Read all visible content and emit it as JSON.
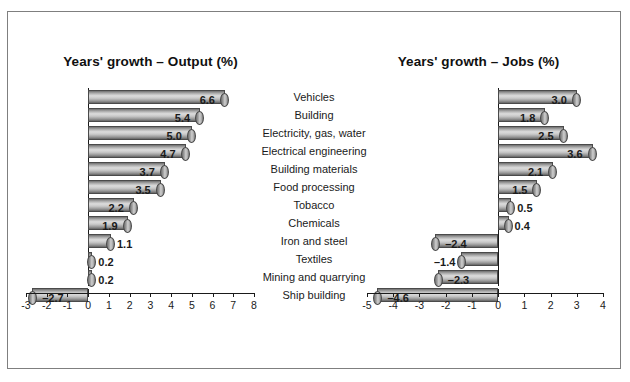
{
  "figure": {
    "border_color": "#7f7f7f",
    "background": "#ffffff"
  },
  "categories": [
    "Vehicles",
    "Building",
    "Electricity, gas, water",
    "Electrical engineering",
    "Building materials",
    "Food processing",
    "Tobacco",
    "Chemicals",
    "Iron and steel",
    "Textiles",
    "Mining and quarrying",
    "Ship building"
  ],
  "chart_data": [
    {
      "type": "bar",
      "orientation": "horizontal",
      "title": "Years' growth – Output (%)",
      "xlabel": "",
      "ylabel": "",
      "xlim": [
        -3,
        8
      ],
      "xticks": [
        -3,
        -2,
        -1,
        0,
        1,
        2,
        3,
        4,
        5,
        6,
        7,
        8
      ],
      "xticklabels": [
        "-3",
        "-2",
        "-1",
        "0",
        "1",
        "2",
        "3",
        "4",
        "5",
        "6",
        "7",
        "8"
      ],
      "grid": false,
      "legend": "none",
      "categories": [
        "Vehicles",
        "Building",
        "Electricity, gas, water",
        "Electrical engineering",
        "Building materials",
        "Food processing",
        "Tobacco",
        "Chemicals",
        "Iron and steel",
        "Textiles",
        "Mining and quarrying",
        "Ship building"
      ],
      "values": [
        6.6,
        5.4,
        5.0,
        4.7,
        3.7,
        3.5,
        2.2,
        1.9,
        1.1,
        0.2,
        0.2,
        -2.7
      ],
      "datalabels": [
        "6.6",
        "5.4",
        "5.0",
        "4.7",
        "3.7",
        "3.5",
        "2.2",
        "1.9",
        "1.1",
        "0.2",
        "0.2",
        "–2.7"
      ]
    },
    {
      "type": "bar",
      "orientation": "horizontal",
      "title": "Years' growth – Jobs (%)",
      "xlabel": "",
      "ylabel": "",
      "xlim": [
        -5,
        4
      ],
      "xticks": [
        -5,
        -4,
        -3,
        -2,
        -1,
        0,
        1,
        2,
        3,
        4
      ],
      "xticklabels": [
        "-5",
        "-4",
        "-3",
        "-2",
        "-1",
        "0",
        "1",
        "2",
        "3",
        "4"
      ],
      "grid": false,
      "legend": "none",
      "categories": [
        "Vehicles",
        "Building",
        "Electricity, gas, water",
        "Electrical engineering",
        "Building materials",
        "Food processing",
        "Tobacco",
        "Chemicals",
        "Iron and steel",
        "Textiles",
        "Mining and quarrying",
        "Ship building"
      ],
      "values": [
        3.0,
        1.8,
        2.5,
        3.6,
        2.1,
        1.5,
        0.5,
        0.4,
        -2.4,
        -1.4,
        -2.3,
        -4.6
      ],
      "datalabels": [
        "3.0",
        "1.8",
        "2.5",
        "3.6",
        "2.1",
        "1.5",
        "0.5",
        "0.4",
        "–2.4",
        "–1.4",
        "–2.3",
        "–4.6"
      ]
    }
  ]
}
